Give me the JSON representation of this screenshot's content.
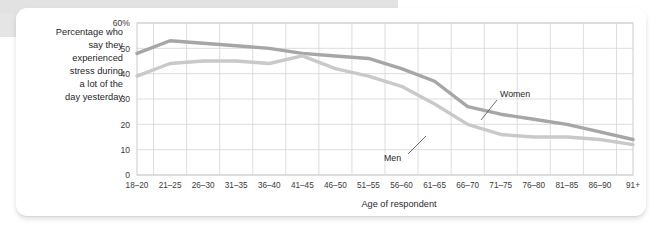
{
  "figure": {
    "y_axis_caption_lines": [
      "Percentage who",
      "say they",
      "experienced",
      "stress during",
      "a lot of the",
      "day yesterday"
    ],
    "x_axis_title": "Age of respondent",
    "annotations": {
      "women_label": "Women",
      "men_label": "Men"
    },
    "colors": {
      "women_line": "#a6a6a6",
      "men_line": "#c9c9c9",
      "grid": "#d9d9d9",
      "plot_border": "#cccccc",
      "text": "#1f1f1f",
      "card_background": "#ffffff",
      "band": "#e2e2e2"
    }
  },
  "chart_data": {
    "type": "line",
    "title": "",
    "subtitle": "",
    "xlabel": "Age of respondent",
    "ylabel": "Percentage who say they experienced stress during a lot of the day yesterday",
    "categories": [
      "18–20",
      "21–25",
      "26–30",
      "31–35",
      "36–40",
      "41–45",
      "46–50",
      "51–55",
      "56–60",
      "61–65",
      "66–70",
      "71–75",
      "76–80",
      "81–85",
      "86–90",
      "91+"
    ],
    "ylim": [
      0,
      60
    ],
    "yticks": [
      0,
      10,
      20,
      30,
      40,
      50,
      60
    ],
    "ytick_labels": [
      "0",
      "10",
      "20",
      "30",
      "40",
      "50",
      "60%"
    ],
    "grid": true,
    "legend_position": "inline-annotations",
    "series": [
      {
        "name": "Women",
        "color": "#a6a6a6",
        "values": [
          48,
          53,
          52,
          51,
          50,
          48,
          47,
          46,
          42,
          37,
          27,
          24,
          22,
          20,
          17,
          14
        ]
      },
      {
        "name": "Men",
        "color": "#c9c9c9",
        "values": [
          39,
          44,
          45,
          45,
          44,
          47,
          42,
          39,
          35,
          28,
          20,
          16,
          15,
          15,
          14,
          12
        ]
      }
    ]
  }
}
